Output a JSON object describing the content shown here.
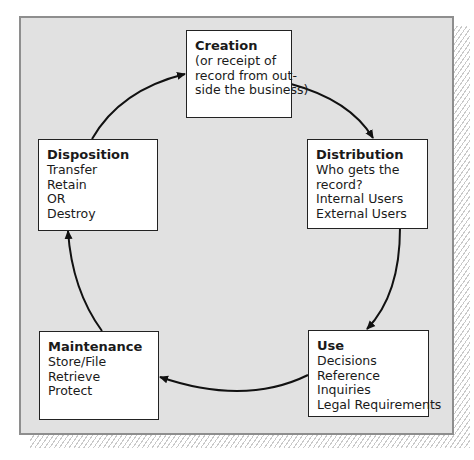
{
  "diagram": {
    "type": "cycle",
    "direction": "clockwise",
    "stages": [
      {
        "id": "creation",
        "title": "Creation",
        "lines": [
          "(or receipt of",
          "record from out-",
          "side the business)"
        ]
      },
      {
        "id": "distribution",
        "title": "Distribution",
        "lines": [
          "Who gets the",
          "record?",
          "Internal Users",
          "External Users"
        ]
      },
      {
        "id": "use",
        "title": "Use",
        "lines": [
          "Decisions",
          "Reference",
          "Inquiries",
          "Legal Requirements"
        ]
      },
      {
        "id": "maintenance",
        "title": "Maintenance",
        "lines": [
          "Store/File",
          "Retrieve",
          "Protect"
        ]
      },
      {
        "id": "disposition",
        "title": "Disposition",
        "lines": [
          "Transfer",
          "Retain",
          "OR",
          "Destroy"
        ]
      }
    ],
    "edges": [
      {
        "from": "creation",
        "to": "distribution"
      },
      {
        "from": "distribution",
        "to": "use"
      },
      {
        "from": "use",
        "to": "maintenance"
      },
      {
        "from": "maintenance",
        "to": "disposition"
      },
      {
        "from": "disposition",
        "to": "creation"
      }
    ],
    "colors": {
      "panel": "#e1e1e1",
      "panel_border": "#8e8e8e",
      "box": "#ffffff",
      "line": "#111111"
    }
  }
}
